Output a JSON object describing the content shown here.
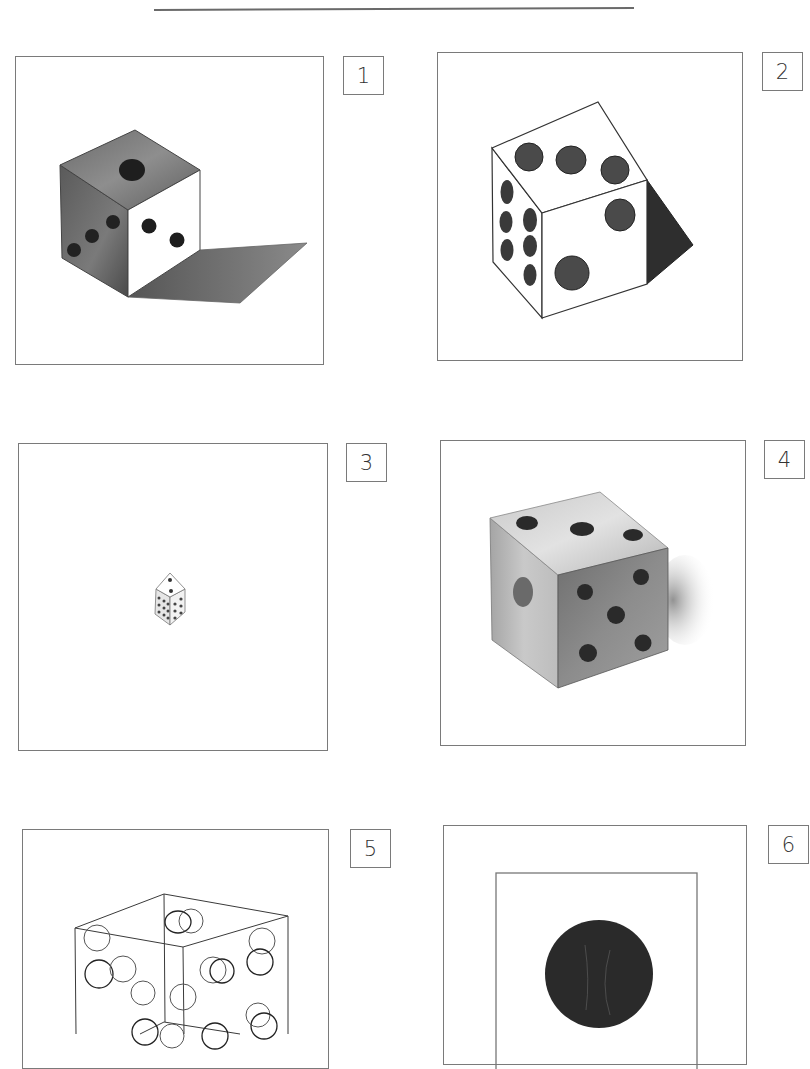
{
  "header": {
    "rule": "horizontal-divider"
  },
  "panels": [
    {
      "id": 1,
      "label": "1",
      "description": "Shaded die with cast shadow, top shows 1 pip, left face 3 pips, front face 2 pips"
    },
    {
      "id": 2,
      "label": "2",
      "description": "Line-drawn die with filled pips, top 3 pips, left face 6 pips, front face 2 pips, dark shadow triangle"
    },
    {
      "id": 3,
      "label": "3",
      "description": "Very small die centered in large empty frame"
    },
    {
      "id": 4,
      "label": "4",
      "description": "Graphite shaded die, top 3 pips, left face 1 pip, front face 5 pips"
    },
    {
      "id": 5,
      "label": "5",
      "description": "Transparent wireframe cube with outlined overlapping circles"
    },
    {
      "id": 6,
      "label": "6",
      "description": "Inner square frame containing a single large dark circle"
    }
  ],
  "colors": {
    "frame": "#7a7a7a",
    "ink": "#2a2a2a",
    "shade_dark": "#555555",
    "shade_mid": "#8a8a8a",
    "shade_light": "#c8c8c8"
  }
}
